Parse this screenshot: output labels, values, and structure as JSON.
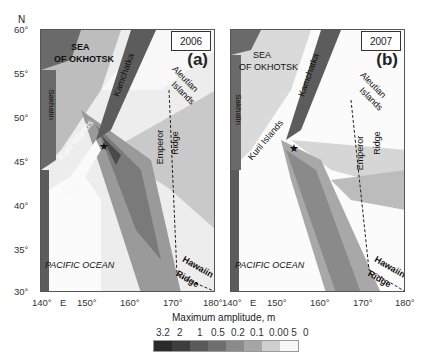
{
  "axes": {
    "north_label": "N",
    "y_ticks": [
      "60°",
      "55°",
      "50°",
      "45°",
      "40°",
      "35°",
      "30°"
    ],
    "x_ticks_a": [
      "140°",
      "E",
      "150°",
      "160°",
      "170°",
      "180°"
    ],
    "x_ticks_b": [
      "140°",
      "E",
      "150°",
      "160°",
      "170°",
      "180°"
    ],
    "x_label": "Maximum amplitude, m"
  },
  "panels": [
    {
      "id": "a",
      "year": "2006",
      "label": "(a)",
      "places": {
        "sea1": "SEA",
        "sea2": "OF OKHOTSK",
        "kamchatka": "Kamchatka",
        "aleutian1": "Aleutian",
        "aleutian2": "Islands",
        "sakhalin": "Sakhalin",
        "kuril": "Kuril Islands",
        "emperor1": "Emperor",
        "emperor2": "Ridge",
        "pacific": "PACIFIC OCEAN",
        "hawaii1": "Hawaiin",
        "hawaii2": "Ridge"
      }
    },
    {
      "id": "b",
      "year": "2007",
      "label": "(b)",
      "places": {
        "sea1": "SEA",
        "sea2": "OF OKHOTSK",
        "kamchatka": "Kamchatka",
        "aleutian1": "Aleutian",
        "aleutian2": "Islands",
        "sakhalin": "Sakhalin",
        "kuril": "Kuril Islands",
        "emperor1": "Emperor",
        "emperor2": "Ridge",
        "pacific": "PACIFIC OCEAN",
        "hawaii1": "Hawaiin",
        "hawaii2": "Ridge"
      }
    }
  ],
  "colorbar": {
    "labels": [
      "3.2",
      "2",
      "1",
      "0.5",
      "0.2",
      "0.1",
      "0.00 5",
      "0"
    ],
    "colors": [
      "#2a2a2a",
      "#3d3d3d",
      "#5a5a5a",
      "#6e6e6e",
      "#8a8a8a",
      "#a6a6a6",
      "#cfcfcf",
      "#f7f7f7"
    ]
  }
}
